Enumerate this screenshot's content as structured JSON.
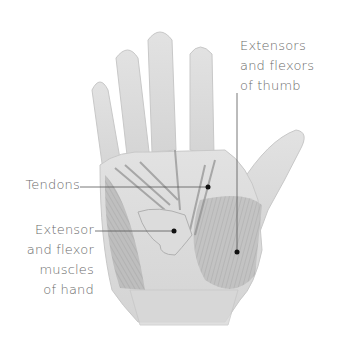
{
  "diagram": {
    "labels": [
      {
        "id": "thumb",
        "text": "Extensors\nand flexors\nof thumb"
      },
      {
        "id": "tendons",
        "text": "Tendons"
      },
      {
        "id": "hand_muscles",
        "text": "Extensor\nand flexor\nmuscles\nof hand"
      }
    ]
  },
  "colors": {
    "skin": "#d9d9d9",
    "muscle": "#a9a9a9",
    "line": "#555555",
    "text": "#6a6a6a"
  }
}
